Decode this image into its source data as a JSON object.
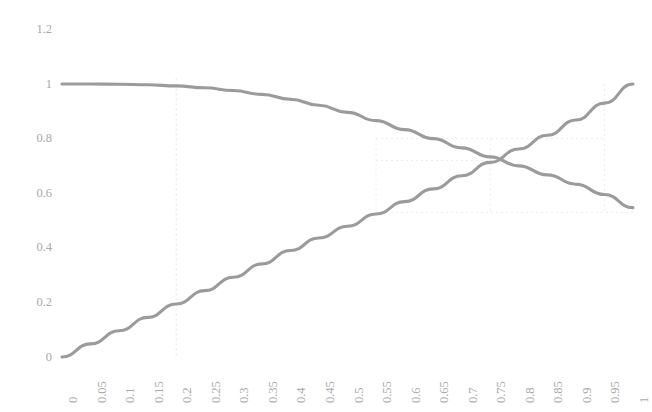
{
  "chart_data": {
    "type": "line",
    "title": "",
    "subtitle": "",
    "xlabel": "",
    "ylabel": "",
    "xlim": [
      0,
      1
    ],
    "ylim": [
      0,
      1.2
    ],
    "grid": false,
    "legend": false,
    "legend_position": "none",
    "line_color": "#9b9b9b",
    "guide_color": "#e2e2e6",
    "tick_label_color": "#a8a8a8",
    "background_color": "#ffffff",
    "x_tick_rotation_degrees": -90,
    "y_ticks": [
      "0",
      "0.2",
      "0.4",
      "0.6",
      "0.8",
      "1",
      "1.2"
    ],
    "y_tick_values": [
      0,
      0.2,
      0.4,
      0.6,
      0.8,
      1,
      1.2
    ],
    "x_ticks": [
      "0",
      "0.05",
      "0.1",
      "0.15",
      "0.2",
      "0.25",
      "0.3",
      "0.35",
      "0.4",
      "0.45",
      "0.5",
      "0.55",
      "0.6",
      "0.65",
      "0.7",
      "0.75",
      "0.8",
      "0.85",
      "0.9",
      "0.95",
      "1"
    ],
    "categories": [
      0,
      0.05,
      0.1,
      0.15,
      0.2,
      0.25,
      0.3,
      0.35,
      0.4,
      0.45,
      0.5,
      0.55,
      0.6,
      0.65,
      0.7,
      0.75,
      0.8,
      0.85,
      0.9,
      0.95,
      1
    ],
    "series": [
      {
        "name": "rising",
        "values": [
          0.0,
          0.048,
          0.096,
          0.145,
          0.194,
          0.243,
          0.292,
          0.341,
          0.39,
          0.436,
          0.479,
          0.524,
          0.569,
          0.616,
          0.664,
          0.713,
          0.762,
          0.812,
          0.868,
          0.93,
          1.0
        ]
      },
      {
        "name": "falling",
        "values": [
          1.0,
          1.0,
          0.999,
          0.997,
          0.993,
          0.986,
          0.976,
          0.962,
          0.944,
          0.922,
          0.896,
          0.866,
          0.833,
          0.8,
          0.766,
          0.733,
          0.7,
          0.667,
          0.633,
          0.595,
          0.547
        ]
      }
    ],
    "annotations": [
      {
        "name": "intersection",
        "x": 0.715,
        "y": 0.72,
        "label": ""
      }
    ],
    "guides": [
      {
        "name": "vertical-guide-0.2",
        "orientation": "vertical",
        "x": 0.2
      },
      {
        "name": "vertical-guide-0.55",
        "orientation": "vertical",
        "x": 0.55
      },
      {
        "name": "vertical-guide-0.75",
        "orientation": "vertical",
        "x": 0.75
      },
      {
        "name": "vertical-guide-0.95",
        "orientation": "vertical",
        "x": 0.95
      },
      {
        "name": "horizontal-guide-0.8",
        "orientation": "horizontal",
        "y": 0.8
      },
      {
        "name": "horizontal-guide-0.72",
        "orientation": "horizontal",
        "y": 0.72
      },
      {
        "name": "horizontal-guide-0.53",
        "orientation": "horizontal",
        "y": 0.53
      }
    ]
  }
}
